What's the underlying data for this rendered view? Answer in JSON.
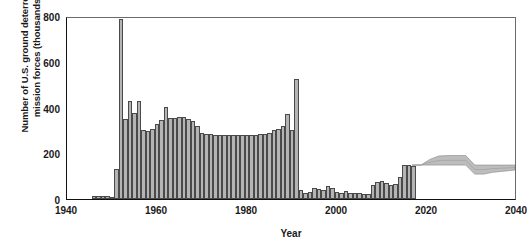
{
  "chart_data": {
    "type": "bar",
    "title": "",
    "xlabel": "Year",
    "ylabel": "Number of U.S. ground deterrence mission forces (thousands)",
    "ylabel_line1": "Number of U.S. ground deterrence",
    "ylabel_line2": "mission forces (thousands)",
    "xlim": [
      1940,
      2040
    ],
    "ylim": [
      0,
      800
    ],
    "xticks": [
      1940,
      1960,
      1980,
      2000,
      2020,
      2040
    ],
    "xticklabels": [
      "1940",
      "1960",
      "1980",
      "2000",
      "2020",
      "2040"
    ],
    "yticks": [
      0,
      200,
      400,
      600,
      800
    ],
    "yticklabels": [
      "0",
      "200",
      "400",
      "600",
      "800"
    ],
    "grid": false,
    "legend": null,
    "bar_color": "#b4b4b4",
    "bar_edge_color": "#4a4a4a",
    "band_color": "#bdbdbd",
    "axis_color": "#111111",
    "x": [
      1946,
      1947,
      1948,
      1949,
      1950,
      1951,
      1952,
      1953,
      1954,
      1955,
      1956,
      1957,
      1958,
      1959,
      1960,
      1961,
      1962,
      1963,
      1964,
      1965,
      1966,
      1967,
      1968,
      1969,
      1970,
      1971,
      1972,
      1973,
      1974,
      1975,
      1976,
      1977,
      1978,
      1979,
      1980,
      1981,
      1982,
      1983,
      1984,
      1985,
      1986,
      1987,
      1988,
      1989,
      1990,
      1991,
      1992,
      1993,
      1994,
      1995,
      1996,
      1997,
      1998,
      1999,
      2000,
      2001,
      2002,
      2003,
      2004,
      2005,
      2006,
      2007,
      2008,
      2009,
      2010,
      2011,
      2012,
      2013,
      2014,
      2015,
      2016,
      2017
    ],
    "values": [
      14,
      15,
      15,
      14,
      8,
      130,
      785,
      350,
      428,
      375,
      430,
      300,
      298,
      305,
      330,
      345,
      404,
      352,
      355,
      358,
      357,
      350,
      340,
      320,
      290,
      285,
      285,
      282,
      278,
      280,
      280,
      280,
      280,
      280,
      278,
      280,
      280,
      285,
      285,
      290,
      300,
      305,
      318,
      370,
      300,
      525,
      40,
      28,
      32,
      50,
      45,
      38,
      55,
      50,
      30,
      28,
      33,
      28,
      27,
      25,
      20,
      22,
      60,
      75,
      80,
      72,
      60,
      65,
      98,
      148,
      150,
      145
    ],
    "projection": {
      "start_year": 2017,
      "end_year": 2040,
      "years": [
        2017,
        2019,
        2021,
        2023,
        2025,
        2027,
        2029,
        2031,
        2033,
        2035,
        2037,
        2040
      ],
      "upper": [
        150,
        150,
        175,
        190,
        192,
        192,
        192,
        150,
        150,
        150,
        150,
        150
      ],
      "lower": [
        150,
        150,
        150,
        150,
        150,
        150,
        150,
        110,
        110,
        118,
        122,
        128
      ],
      "center": [
        150,
        150,
        162,
        170,
        171,
        171,
        171,
        130,
        130,
        134,
        136,
        139
      ]
    }
  }
}
